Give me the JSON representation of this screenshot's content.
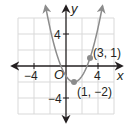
{
  "chart_data": {
    "type": "line",
    "title": "",
    "xlabel": "x",
    "ylabel": "y",
    "xlim": [
      -6,
      6
    ],
    "ylim": [
      -6,
      6
    ],
    "grid": true,
    "grid_step": 2,
    "x_tick_labels": [
      {
        "value": -4,
        "label": "−4"
      },
      {
        "value": 4,
        "label": "4"
      }
    ],
    "y_tick_labels": [
      {
        "value": 4,
        "label": "4"
      },
      {
        "value": -4,
        "label": "−4"
      }
    ],
    "origin_label": "O",
    "series": [
      {
        "name": "parabola",
        "equation": "y = 0.75(x - 1)^2 - 2",
        "vertex": [
          1,
          -2
        ],
        "x": [
          -2.56,
          -2,
          -1,
          0,
          1,
          2,
          3,
          4,
          4.56
        ],
        "values": [
          7.5,
          4.75,
          1,
          -1.25,
          -2,
          -1.25,
          1,
          4.75,
          7.5
        ],
        "color": "#8c8c8c",
        "arrows_both_ends": true
      }
    ],
    "points": [
      {
        "x": 1,
        "y": -2,
        "label": "(1, −2)"
      },
      {
        "x": 3,
        "y": 1,
        "label": "(3, 1)"
      }
    ],
    "legend": null
  },
  "labels": {
    "x_axis": "x",
    "y_axis": "y",
    "origin": "O",
    "x_neg4": "−4",
    "x_pos4": "4",
    "y_pos4": "4",
    "y_neg4": "−4",
    "vertex_point": "(1, −2)",
    "point_3_1": "(3, 1)"
  },
  "colors": {
    "axis": "#231f20",
    "grid": "#d9d9d9",
    "curve": "#8c8c8c",
    "point": "#8c8c8c"
  }
}
